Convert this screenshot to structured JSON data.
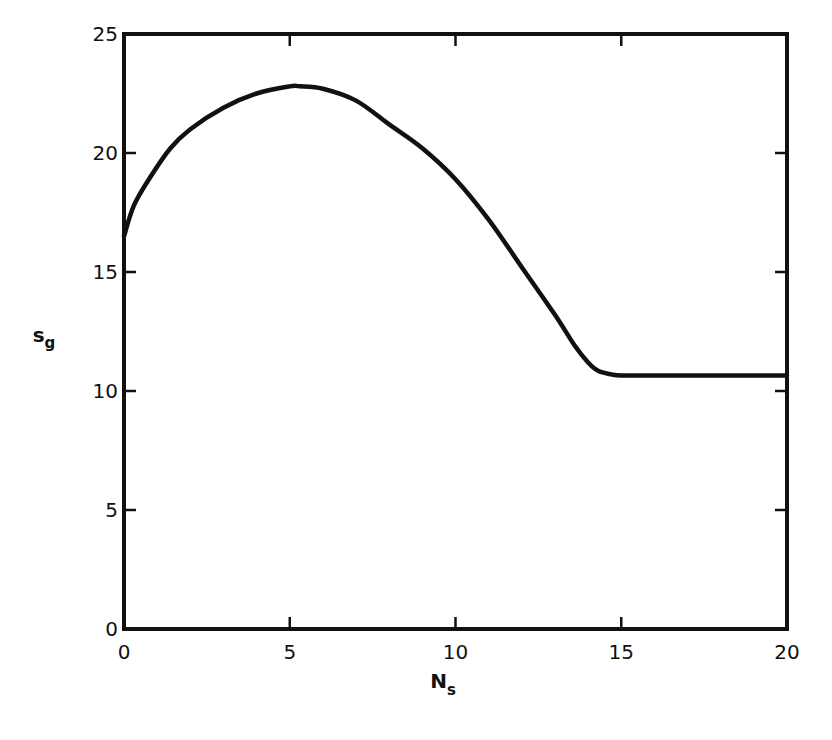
{
  "chart_data": {
    "type": "line",
    "title": "",
    "xlabel": "N",
    "xlabel_subscript": "s",
    "ylabel": "s",
    "ylabel_subscript": "g",
    "xlim": [
      0,
      20
    ],
    "ylim": [
      0,
      25
    ],
    "x_ticks": [
      0,
      5,
      10,
      15,
      20
    ],
    "y_ticks": [
      0,
      5,
      10,
      15,
      20,
      25
    ],
    "x_tick_labels": [
      "0",
      "5",
      "10",
      "15",
      "20"
    ],
    "y_tick_labels": [
      "0",
      "5",
      "10",
      "15",
      "20",
      "25"
    ],
    "grid": false,
    "legend": null,
    "series": [
      {
        "name": "s_g vs N_s",
        "color": "#111111",
        "x": [
          0,
          0.3,
          0.8,
          1.4,
          2,
          3,
          4,
          5,
          5.3,
          6,
          7,
          8,
          9,
          10,
          11,
          12,
          13,
          13.6,
          14,
          14.3,
          14.7,
          15,
          16,
          17,
          18,
          19,
          20
        ],
        "y": [
          16.5,
          17.8,
          19.0,
          20.2,
          21.0,
          21.9,
          22.5,
          22.8,
          22.8,
          22.7,
          22.2,
          21.2,
          20.2,
          18.9,
          17.2,
          15.2,
          13.2,
          11.9,
          11.2,
          10.85,
          10.7,
          10.65,
          10.65,
          10.65,
          10.65,
          10.65,
          10.65
        ]
      }
    ]
  }
}
